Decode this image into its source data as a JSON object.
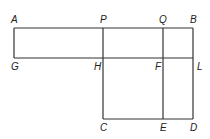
{
  "labels": {
    "A": "A",
    "P": "P",
    "Q": "Q",
    "B": "B",
    "G": "G",
    "H": "H",
    "F": "F",
    "L": "L",
    "C": "C",
    "E": "E",
    "D": "D"
  }
}
